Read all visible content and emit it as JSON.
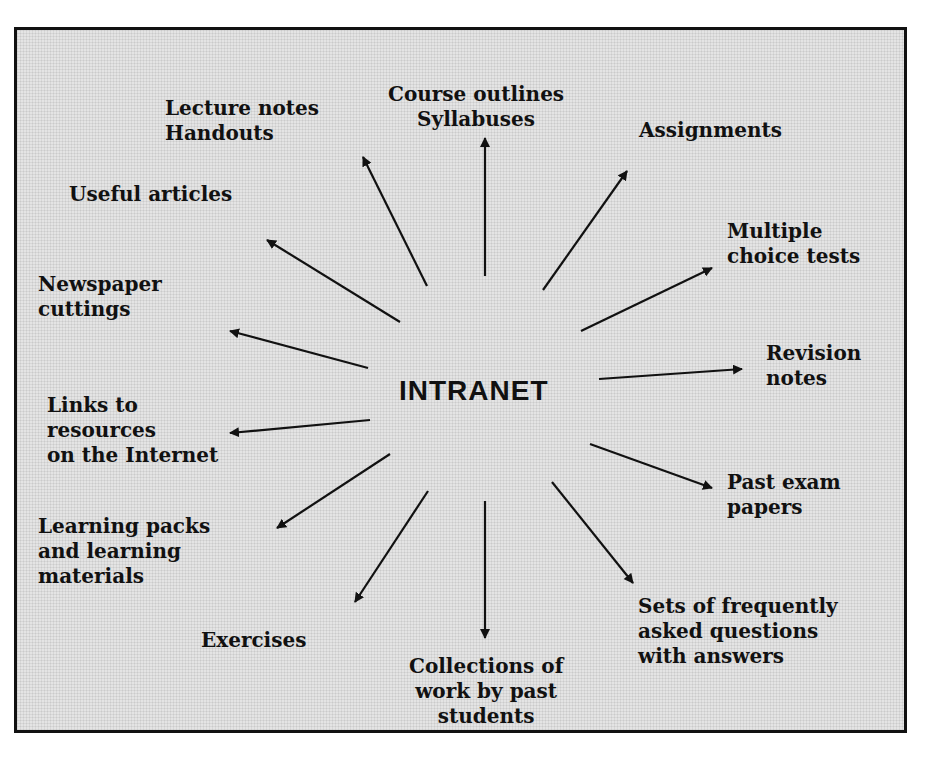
{
  "diagram": {
    "center": "INTRANET",
    "nodes": [
      {
        "id": "course-outlines",
        "label": "Course outlines\nSyllabuses"
      },
      {
        "id": "assignments",
        "label": "Assignments"
      },
      {
        "id": "multiple-choice",
        "label": "Multiple\nchoice tests"
      },
      {
        "id": "revision-notes",
        "label": "Revision\nnotes"
      },
      {
        "id": "past-exam",
        "label": "Past exam\npapers"
      },
      {
        "id": "faq",
        "label": "Sets of frequently\nasked questions\nwith answers"
      },
      {
        "id": "collections",
        "label": "Collections of\nwork by past\nstudents"
      },
      {
        "id": "exercises",
        "label": "Exercises"
      },
      {
        "id": "learning-packs",
        "label": "Learning packs\nand learning\nmaterials"
      },
      {
        "id": "links",
        "label": "Links to\nresources\non the Internet"
      },
      {
        "id": "newspaper",
        "label": "Newspaper\ncuttings"
      },
      {
        "id": "useful-articles",
        "label": "Useful articles"
      },
      {
        "id": "lecture-notes",
        "label": "Lecture notes\nHandouts"
      }
    ],
    "edges": [
      {
        "from": "INTRANET",
        "to": "course-outlines"
      },
      {
        "from": "INTRANET",
        "to": "assignments"
      },
      {
        "from": "INTRANET",
        "to": "multiple-choice"
      },
      {
        "from": "INTRANET",
        "to": "revision-notes"
      },
      {
        "from": "INTRANET",
        "to": "past-exam"
      },
      {
        "from": "INTRANET",
        "to": "faq"
      },
      {
        "from": "INTRANET",
        "to": "collections"
      },
      {
        "from": "INTRANET",
        "to": "exercises"
      },
      {
        "from": "INTRANET",
        "to": "learning-packs"
      },
      {
        "from": "INTRANET",
        "to": "links"
      },
      {
        "from": "INTRANET",
        "to": "newspaper"
      },
      {
        "from": "INTRANET",
        "to": "useful-articles"
      },
      {
        "from": "INTRANET",
        "to": "lecture-notes"
      }
    ]
  }
}
